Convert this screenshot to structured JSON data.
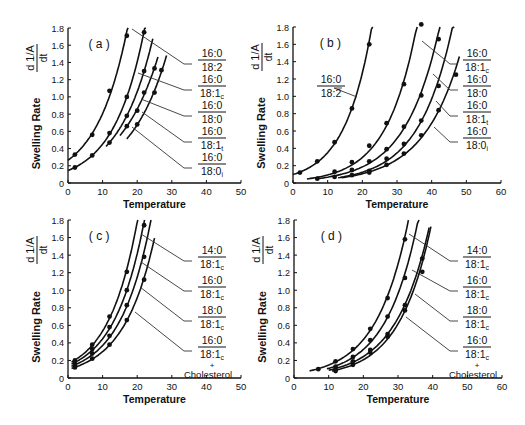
{
  "chart_data": [
    {
      "panel": "(a)",
      "type": "line",
      "xlabel": "Temperature",
      "ylabel": "Swelling Rate",
      "ylabel_formula": "d(1/A)/dt",
      "xlim": [
        0,
        50
      ],
      "ylim": [
        0,
        1.8
      ],
      "xticks": [
        0,
        10,
        20,
        30,
        40,
        50
      ],
      "yticks": [
        0,
        0.2,
        0.4,
        0.6,
        0.8,
        1.0,
        1.2,
        1.4,
        1.6,
        1.8
      ],
      "series": [
        {
          "name": "16:0/18:2",
          "x": [
            2,
            7,
            12,
            17
          ],
          "y": [
            0.33,
            0.56,
            1.07,
            1.71
          ],
          "curve_x": [
            0,
            18
          ]
        },
        {
          "name": "16:0/18:1c",
          "x": [
            2,
            7,
            12,
            17,
            22
          ],
          "y": [
            0.18,
            0.32,
            0.58,
            1.0,
            1.75
          ],
          "curve_x": [
            0,
            22.5
          ]
        },
        {
          "name": "16:0/18:0",
          "x": [
            12,
            17,
            22
          ],
          "y": [
            0.47,
            0.78,
            1.3
          ],
          "curve_x": [
            11,
            24.5
          ]
        },
        {
          "name": "16:0/18:1t",
          "x": [
            17,
            20,
            22,
            25
          ],
          "y": [
            0.66,
            0.84,
            1.05,
            1.33
          ],
          "curve_x": [
            15,
            26
          ]
        },
        {
          "name": "16:0/18:0i",
          "x": [
            20,
            25,
            27
          ],
          "y": [
            0.68,
            1.05,
            1.31
          ],
          "curve_x": [
            17,
            28.5
          ]
        }
      ]
    },
    {
      "panel": "(b)",
      "type": "line",
      "xlabel": "Temperature",
      "ylabel": "Swelling Rate",
      "ylabel_formula": "d(1/A)/dt",
      "xlim": [
        0,
        60
      ],
      "ylim": [
        0,
        1.8
      ],
      "xticks": [
        0,
        10,
        20,
        30,
        40,
        50,
        60
      ],
      "yticks": [
        0,
        0.2,
        0.4,
        0.6,
        0.8,
        1.0,
        1.2,
        1.4,
        1.6,
        1.8
      ],
      "series": [
        {
          "name": "16:0/18:2",
          "x": [
            2,
            7,
            12,
            17,
            22
          ],
          "y": [
            0.12,
            0.25,
            0.47,
            0.86,
            1.6
          ],
          "curve_x": [
            0,
            23
          ]
        },
        {
          "name": "16:0/18:1c",
          "x": [
            7,
            12,
            17,
            22,
            27,
            32,
            37
          ],
          "y": [
            0.05,
            0.13,
            0.24,
            0.43,
            0.69,
            1.14,
            1.83
          ],
          "curve_x": [
            4,
            37.5
          ]
        },
        {
          "name": "16:0/18:0",
          "x": [
            12,
            17,
            22,
            27,
            32,
            37,
            42
          ],
          "y": [
            0.07,
            0.15,
            0.25,
            0.39,
            0.65,
            1.01,
            1.66
          ],
          "curve_x": [
            7,
            43
          ]
        },
        {
          "name": "16:0/18:1t",
          "x": [
            17,
            22,
            27,
            32,
            37,
            42
          ],
          "y": [
            0.09,
            0.14,
            0.28,
            0.45,
            0.72,
            1.12
          ],
          "curve_x": [
            13,
            46.5
          ]
        },
        {
          "name": "16:0/18:0i",
          "x": [
            22,
            27,
            32,
            37,
            42,
            47
          ],
          "y": [
            0.12,
            0.21,
            0.34,
            0.55,
            0.84,
            1.25
          ],
          "curve_x": [
            14,
            48
          ]
        }
      ]
    },
    {
      "panel": "(c)",
      "type": "line",
      "xlabel": "Temperature",
      "ylabel": "Swelling Rate",
      "ylabel_formula": "d(1/A)/dt",
      "xlim": [
        0,
        50
      ],
      "ylim": [
        0,
        1.8
      ],
      "xticks": [
        0,
        10,
        20,
        30,
        40,
        50
      ],
      "yticks": [
        0,
        0.2,
        0.4,
        0.6,
        0.8,
        1.0,
        1.2,
        1.4,
        1.6,
        1.8
      ],
      "series": [
        {
          "name": "14:0/18:1c",
          "x": [
            2,
            7,
            12,
            17
          ],
          "y": [
            0.2,
            0.38,
            0.7,
            1.21
          ],
          "curve_x": [
            1,
            20.5
          ]
        },
        {
          "name": "16:0/18:1c",
          "x": [
            2,
            7,
            12,
            17,
            22
          ],
          "y": [
            0.17,
            0.33,
            0.58,
            1.0,
            1.74
          ],
          "curve_x": [
            1,
            22.5
          ]
        },
        {
          "name": "18:0/18:1c",
          "x": [
            2,
            7,
            12,
            17,
            22
          ],
          "y": [
            0.14,
            0.28,
            0.48,
            0.83,
            1.38
          ],
          "curve_x": [
            1,
            24
          ]
        },
        {
          "name": "16:0/18:1c + Cholesterol",
          "x": [
            2,
            7,
            12,
            17,
            22
          ],
          "y": [
            0.12,
            0.22,
            0.38,
            0.66,
            1.12
          ],
          "curve_x": [
            1,
            25
          ]
        }
      ]
    },
    {
      "panel": "(d)",
      "type": "line",
      "xlabel": "Temperature",
      "ylabel": "Swelling Rate",
      "ylabel_formula": "d(1/A)/dt",
      "xlim": [
        0,
        60
      ],
      "ylim": [
        0,
        1.8
      ],
      "xticks": [
        0,
        10,
        20,
        30,
        40,
        50,
        60
      ],
      "yticks": [
        0,
        0.2,
        0.4,
        0.6,
        0.8,
        1.0,
        1.2,
        1.4,
        1.6,
        1.8
      ],
      "series": [
        {
          "name": "14:0/18:1c",
          "x": [
            7,
            12,
            17,
            22,
            27,
            32
          ],
          "y": [
            0.1,
            0.19,
            0.33,
            0.56,
            0.91,
            1.58
          ],
          "curve_x": [
            4.5,
            33
          ]
        },
        {
          "name": "16:0/18:1c",
          "x": [
            12,
            17,
            22,
            27,
            32
          ],
          "y": [
            0.13,
            0.24,
            0.43,
            0.7,
            1.14
          ],
          "curve_x": [
            9.5,
            36.5
          ]
        },
        {
          "name": "18:0/18:1c",
          "x": [
            12,
            17,
            22,
            27,
            32,
            37
          ],
          "y": [
            0.1,
            0.19,
            0.32,
            0.5,
            0.83,
            1.36
          ],
          "curve_x": [
            10,
            39
          ]
        },
        {
          "name": "16:0/18:1c + Cholesterol",
          "x": [
            12,
            17,
            22,
            27,
            32,
            37
          ],
          "y": [
            0.08,
            0.15,
            0.29,
            0.47,
            0.77,
            1.21
          ],
          "curve_x": [
            11,
            39.5
          ]
        }
      ]
    }
  ],
  "panels": [
    {
      "id": "a",
      "label": "( a )",
      "plot": {
        "x0": 68,
        "x1": 241,
        "y0": 183,
        "y1": 28
      },
      "labels": [
        {
          "num": "16:0",
          "den": "18:2",
          "sub": "",
          "x": 198,
          "y": 57,
          "pointer_to": [
            132,
            29
          ],
          "line_end": [
            192,
            64
          ]
        },
        {
          "num": "16:0",
          "den": "18:1",
          "sub": "c",
          "x": 198,
          "y": 83,
          "pointer_to": [
            138,
            73
          ],
          "line_end": [
            192,
            90
          ]
        },
        {
          "num": "16:0",
          "den": "18:0",
          "sub": "",
          "x": 198,
          "y": 109,
          "pointer_to": [
            141,
            99
          ],
          "line_end": [
            192,
            116
          ]
        },
        {
          "num": "16:0",
          "den": "18:1",
          "sub": "t",
          "x": 198,
          "y": 135,
          "pointer_to": [
            142,
            112
          ],
          "line_end": [
            192,
            142
          ]
        },
        {
          "num": "16:0",
          "den": "18:0",
          "sub": "i",
          "x": 198,
          "y": 161,
          "pointer_to": [
            132,
            127
          ],
          "line_end": [
            192,
            168
          ]
        }
      ]
    },
    {
      "id": "b",
      "label": "( b )",
      "plot": {
        "x0": 293,
        "x1": 501,
        "y0": 183,
        "y1": 27
      },
      "labels": [
        {
          "num": "16:0",
          "den": "18:2",
          "sub": "",
          "x": 317,
          "y": 83,
          "pointer_to": [
            357,
            97
          ],
          "line_end": [
            342,
            88
          ]
        },
        {
          "num": "16:0",
          "den": "18:1",
          "sub": "c",
          "x": 463,
          "y": 57,
          "pointer_to": [
            422,
            41
          ],
          "line_end": [
            458,
            64
          ]
        },
        {
          "num": "16:0",
          "den": "18:0",
          "sub": "",
          "x": 463,
          "y": 83,
          "pointer_to": [
            433,
            74
          ],
          "line_end": [
            458,
            90
          ]
        },
        {
          "num": "16:0",
          "den": "18:1",
          "sub": "t",
          "x": 463,
          "y": 109,
          "pointer_to": [
            436,
            101
          ],
          "line_end": [
            458,
            116
          ]
        },
        {
          "num": "16:0",
          "den": "18:0",
          "sub": "i",
          "x": 463,
          "y": 135,
          "pointer_to": [
            434,
            127
          ],
          "line_end": [
            458,
            142
          ]
        }
      ]
    },
    {
      "id": "c",
      "label": "( c )",
      "plot": {
        "x0": 68,
        "x1": 241,
        "y0": 378,
        "y1": 220
      },
      "labels": [
        {
          "num": "14:0",
          "den": "18:1",
          "sub": "c",
          "x": 198,
          "y": 254,
          "pointer_to": [
            141,
            234
          ],
          "line_end": [
            192,
            261
          ]
        },
        {
          "num": "16:0",
          "den": "18:1",
          "sub": "c",
          "x": 198,
          "y": 284,
          "pointer_to": [
            141,
            262
          ],
          "line_end": [
            192,
            291
          ]
        },
        {
          "num": "18:0",
          "den": "18:1",
          "sub": "c",
          "x": 198,
          "y": 314,
          "pointer_to": [
            140,
            287
          ],
          "line_end": [
            192,
            321
          ]
        },
        {
          "num": "16:0",
          "den": "18:1",
          "sub": "c",
          "x": 198,
          "y": 344,
          "pointer_to": [
            135,
            312
          ],
          "line_end": [
            192,
            351
          ],
          "extra": "+",
          "extra2": "Cholesterol"
        }
      ]
    },
    {
      "id": "d",
      "label": "( d )",
      "plot": {
        "x0": 294,
        "x1": 502,
        "y0": 378,
        "y1": 220
      },
      "labels": [
        {
          "num": "14:0",
          "den": "18:1",
          "sub": "c",
          "x": 463,
          "y": 254,
          "pointer_to": [
            409,
            234
          ],
          "line_end": [
            458,
            261
          ]
        },
        {
          "num": "16:0",
          "den": "18:1",
          "sub": "c",
          "x": 463,
          "y": 284,
          "pointer_to": [
            412,
            270
          ],
          "line_end": [
            458,
            291
          ]
        },
        {
          "num": "18:0",
          "den": "18:1",
          "sub": "c",
          "x": 463,
          "y": 314,
          "pointer_to": [
            415,
            294
          ],
          "line_end": [
            458,
            321
          ]
        },
        {
          "num": "16:0",
          "den": "18:1",
          "sub": "c",
          "x": 463,
          "y": 344,
          "pointer_to": [
            406,
            317
          ],
          "line_end": [
            458,
            351
          ],
          "extra": "+",
          "extra2": "Cholesterol"
        }
      ]
    }
  ],
  "axis_titles": {
    "x": "Temperature",
    "y": "Swelling Rate",
    "formula_num": "d",
    "formula_frac": "1/A",
    "formula_den": "dt"
  }
}
